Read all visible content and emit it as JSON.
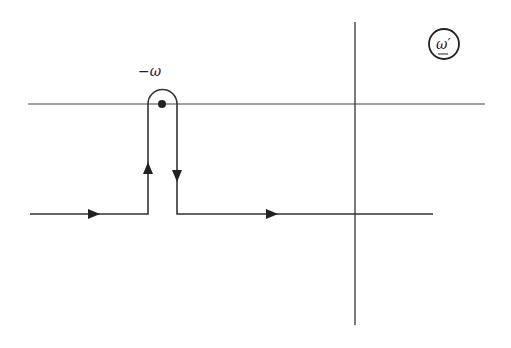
{
  "diagram": {
    "type": "contour-integration-plane",
    "plane_label": "ω′",
    "pole_label": "−ω",
    "colors": {
      "line": "#333333",
      "background": "#ffffff"
    },
    "axes": {
      "imaginary_axis": {
        "x": 355,
        "y1": 22,
        "y2": 325
      },
      "real_axis": {
        "y": 104,
        "x1": 28,
        "x2": 485
      }
    },
    "contour": {
      "level_y": 214,
      "start_x": 30,
      "end_x": 433,
      "indent_left_x": 148,
      "indent_right_x": 177,
      "arc_center": {
        "x": 162,
        "y": 104
      },
      "arc_radius": 14.5,
      "arrows": [
        {
          "x": 100,
          "y": 214,
          "direction": "right"
        },
        {
          "x": 148,
          "y": 168,
          "direction": "up"
        },
        {
          "x": 177,
          "y": 176,
          "direction": "down"
        },
        {
          "x": 274,
          "y": 214,
          "direction": "right"
        }
      ]
    },
    "pole": {
      "x": 162,
      "y": 104
    }
  }
}
